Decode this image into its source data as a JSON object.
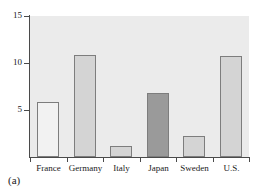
{
  "figure": {
    "caption": "(a)",
    "background_color": "#ffffff",
    "plot_background_color": "#ebebeb",
    "axis_color": "#4a4a4a",
    "bar_edge_color": "#7d7d7d"
  },
  "chart_data": {
    "type": "bar",
    "title": "",
    "subtitle": "",
    "xlabel": "",
    "ylabel": "",
    "categories": [
      "France",
      "Germany",
      "Italy",
      "Japan",
      "Sweden",
      "U.S."
    ],
    "values": [
      5.8,
      10.9,
      1.2,
      6.8,
      2.2,
      10.7
    ],
    "bar_colors": [
      "#f2f2f2",
      "#d4d4d4",
      "#d4d4d4",
      "#9a9a9a",
      "#d4d4d4",
      "#d4d4d4"
    ],
    "highlighted_category": "Japan",
    "ylim": [
      0,
      15
    ],
    "yticks": [
      5,
      10,
      15
    ],
    "ytick_labels": [
      "5",
      "10",
      "15"
    ],
    "xlim": [
      0,
      6
    ],
    "grid": false,
    "legend": null,
    "legend_position": "none",
    "annotations": []
  }
}
